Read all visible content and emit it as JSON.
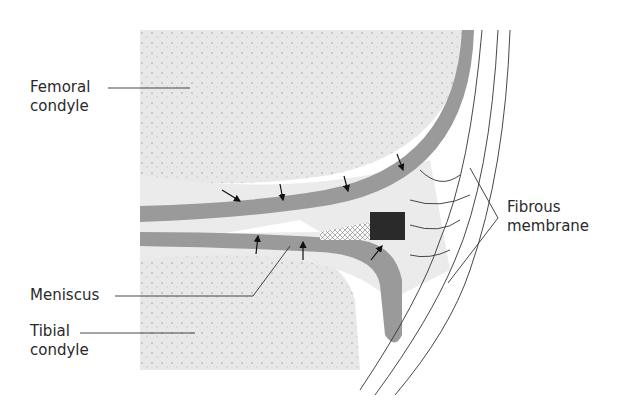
{
  "labels": {
    "femoral_line1": "Femoral",
    "femoral_line2": "condyle",
    "meniscus": "Meniscus",
    "tibial_line1": "Tibial",
    "tibial_line2": "condyle",
    "fibrous_line1": "Fibrous",
    "fibrous_line2": "membrane"
  },
  "colors": {
    "bone": "#e6e6e6",
    "cartilage": "#9a9a9a",
    "capsule": "#d4d4d4",
    "dark_zone": "#2a2a2a",
    "line": "#333333"
  }
}
